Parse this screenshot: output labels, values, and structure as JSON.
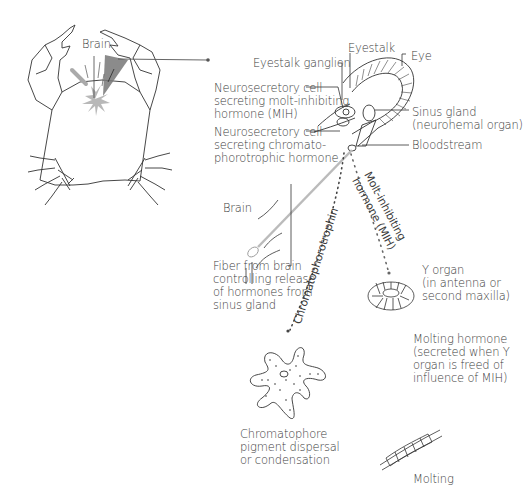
{
  "diagram": {
    "crab": {
      "brain_label": "Brain"
    },
    "eyestalk": {
      "eyestalk_ganglion": "Eyestalk ganglion",
      "eyestalk": "Eyestalk",
      "eye": "Eye",
      "mih_cell": [
        "Neurosecretory cell",
        "secreting molt-inhibiting",
        "hormone (MIH)"
      ],
      "chromato_cell": [
        "Neurosecretory cell",
        "secreting chromato-",
        "phorotrophic hormone"
      ],
      "sinus_gland": [
        "Sinus gland",
        "(neurohemal organ)"
      ],
      "bloodstream": "Bloodstream"
    },
    "brain_fiber": {
      "brain_label": "Brain",
      "fiber": [
        "Fiber from brain",
        "controlling release",
        "of hormones from",
        "sinus gland"
      ]
    },
    "pathways": {
      "chromatophorotrophin": "Chromatophorotrophin",
      "mih": [
        "Molt-inhibiting",
        "hormone (MIH)"
      ]
    },
    "y_organ": [
      "Y organ",
      "(in antenna or",
      "second maxilla)"
    ],
    "molting_hormone": [
      "Molting hormone",
      "(secreted when Y",
      "organ is freed of",
      "influence of MIH)"
    ],
    "chromatophore": [
      "Chromatophore",
      "pigment dispersal",
      "or condensation"
    ],
    "molting": "Molting"
  }
}
